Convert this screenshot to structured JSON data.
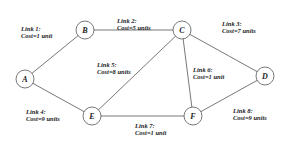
{
  "diagram": {
    "type": "network-graph",
    "nodes": [
      {
        "id": "A",
        "label": "A",
        "x": 25,
        "y": 79
      },
      {
        "id": "B",
        "label": "B",
        "x": 85,
        "y": 30
      },
      {
        "id": "C",
        "label": "C",
        "x": 182,
        "y": 30
      },
      {
        "id": "D",
        "label": "D",
        "x": 265,
        "y": 76
      },
      {
        "id": "E",
        "label": "E",
        "x": 92,
        "y": 116
      },
      {
        "id": "F",
        "label": "F",
        "x": 193,
        "y": 116
      }
    ],
    "links": [
      {
        "id": "link1",
        "from": "A",
        "to": "B",
        "name": "Link 1:",
        "cost": "Cost=1 unit",
        "lx": 21,
        "ly": 26
      },
      {
        "id": "link2",
        "from": "B",
        "to": "C",
        "name": "Link 2:",
        "cost": "Cost=5 units",
        "lx": 117,
        "ly": 18
      },
      {
        "id": "link3",
        "from": "C",
        "to": "D",
        "name": "Link 3:",
        "cost": "Cost=7 units",
        "lx": 222,
        "ly": 21
      },
      {
        "id": "link4",
        "from": "A",
        "to": "E",
        "name": "Link 4:",
        "cost": "Cost=9 units",
        "lx": 26,
        "ly": 109
      },
      {
        "id": "link5",
        "from": "E",
        "to": "C",
        "name": "Link 5:",
        "cost": "Cost=8 units",
        "lx": 97,
        "ly": 62
      },
      {
        "id": "link6",
        "from": "C",
        "to": "F",
        "name": "Link 6:",
        "cost": "Cost=1 unit",
        "lx": 193,
        "ly": 67
      },
      {
        "id": "link7",
        "from": "E",
        "to": "F",
        "name": "Link 7:",
        "cost": "Cost=1 unit",
        "lx": 135,
        "ly": 123
      },
      {
        "id": "link8",
        "from": "F",
        "to": "D",
        "name": "Link 8:",
        "cost": "Cost=9 units",
        "lx": 233,
        "ly": 108
      }
    ],
    "node_radius": 9,
    "colors": {
      "stroke": "#555555",
      "text": "#222222",
      "background": "#ffffff"
    }
  }
}
